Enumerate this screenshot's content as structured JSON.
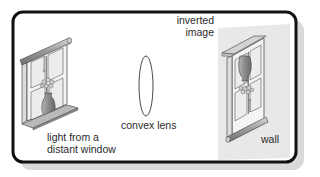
{
  "diagram": {
    "labels": {
      "source_line1": "light from a",
      "source_line2": "distant window",
      "lens": "convex lens",
      "image_line1": "inverted",
      "image_line2": "image",
      "wall": "wall"
    },
    "colors": {
      "frame": "#111111",
      "shadow": "#d6d6d6",
      "wall": "#e6e6e6",
      "window_frame": "#f4f4f4",
      "blind": "#a9a9a9",
      "glass": "#ededed",
      "vase": "#8a8a8a",
      "outline": "#3a3a3a"
    }
  }
}
